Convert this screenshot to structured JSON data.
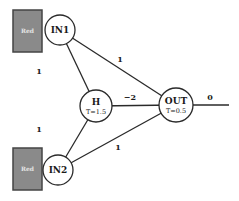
{
  "diagram": {
    "type": "neural-network",
    "colors": {
      "sensor_fill": "#8a8a8a",
      "sensor_border": "#444444",
      "line": "#2a2a2a",
      "background": "#ffffff"
    },
    "sensors": [
      {
        "id": "sensor-top",
        "label": "Red",
        "x": 13,
        "y": 10,
        "w": 29,
        "h": 42
      },
      {
        "id": "sensor-bottom",
        "label": "Red",
        "x": 13,
        "y": 148,
        "w": 29,
        "h": 42
      }
    ],
    "nodes": [
      {
        "id": "IN1",
        "label": "IN1",
        "sub": "",
        "cx": 60,
        "cy": 30,
        "r": 15
      },
      {
        "id": "IN2",
        "label": "IN2",
        "sub": "",
        "cx": 58,
        "cy": 170,
        "r": 15
      },
      {
        "id": "H",
        "label": "H",
        "sub": "T=1.5",
        "cx": 96,
        "cy": 106,
        "r": 16
      },
      {
        "id": "OUT",
        "label": "OUT",
        "sub": "T=0.5",
        "cx": 176,
        "cy": 105,
        "r": 17
      }
    ],
    "edges": [
      {
        "from": "IN1",
        "to": "H",
        "weight": "1",
        "label_x": 39,
        "label_y": 74
      },
      {
        "from": "IN1",
        "to": "OUT",
        "weight": "1",
        "label_x": 120,
        "label_y": 62
      },
      {
        "from": "IN2",
        "to": "H",
        "weight": "1",
        "label_x": 39,
        "label_y": 132
      },
      {
        "from": "IN2",
        "to": "OUT",
        "weight": "1",
        "label_x": 118,
        "label_y": 150
      },
      {
        "from": "H",
        "to": "OUT",
        "weight": "−2",
        "label_x": 130,
        "label_y": 100
      }
    ],
    "output": {
      "weight": "0",
      "x1": 193,
      "y1": 105,
      "x2": 229,
      "y2": 105,
      "label_x": 210,
      "label_y": 100
    }
  }
}
